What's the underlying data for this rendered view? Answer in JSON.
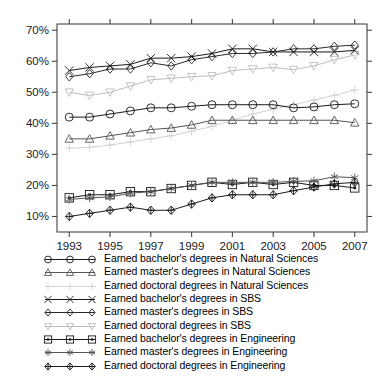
{
  "chart_data": {
    "type": "line",
    "title": "",
    "subtitle": "",
    "xlabel": "",
    "ylabel": "",
    "x": [
      1993,
      1994,
      1995,
      1996,
      1997,
      1998,
      1999,
      2000,
      2001,
      2002,
      2003,
      2004,
      2005,
      2006,
      2007
    ],
    "xlim": [
      1992.4,
      2007.6
    ],
    "ylim": [
      5,
      72
    ],
    "xticks": [
      1993,
      1994,
      1995,
      1996,
      1997,
      1998,
      1999,
      2000,
      2001,
      2002,
      2003,
      2004,
      2005,
      2006,
      2007
    ],
    "xticklabels": [
      "1993",
      "",
      "1995",
      "",
      "1997",
      "",
      "1999",
      "",
      "2001",
      "",
      "2003",
      "",
      "2005",
      "",
      "2007"
    ],
    "yticks": [
      10,
      20,
      30,
      40,
      50,
      60,
      70
    ],
    "yticklabels": [
      "10%",
      "20%",
      "30%",
      "40%",
      "50%",
      "60%",
      "70%"
    ],
    "grid": false,
    "legend_position": "below",
    "series": [
      {
        "name": "Earned bachelor's degrees in Natural Sciences",
        "marker": "circle",
        "color": "#1a1a1a",
        "values": [
          42,
          42,
          43,
          44,
          45,
          45,
          45.5,
          46,
          46,
          46,
          46,
          45,
          45.3,
          46,
          46.3
        ]
      },
      {
        "name": "Earned master's degrees in Natural Sciences",
        "marker": "triangle-up",
        "color": "#555555",
        "values": [
          35,
          35,
          36,
          37,
          38,
          38.5,
          39.5,
          41,
          41,
          41,
          41,
          41,
          41,
          41,
          40.2
        ]
      },
      {
        "name": "Earned doctoral degrees in Natural Sciences",
        "marker": "plus",
        "color": "#d2d2d2",
        "values": [
          32,
          32.3,
          33,
          34,
          35,
          36,
          37.5,
          39,
          41,
          43,
          44.5,
          46,
          47.5,
          49,
          50.8
        ]
      },
      {
        "name": "Earned bachelor's degrees in SBS",
        "marker": "x",
        "color": "#1a1a1a",
        "values": [
          57,
          58,
          58.5,
          59,
          61,
          61,
          61.5,
          62.5,
          64,
          64,
          63,
          63,
          63,
          63,
          63.5
        ]
      },
      {
        "name": "Earned master's degrees in SBS",
        "marker": "diamond",
        "color": "#2b2b2b",
        "values": [
          55,
          56,
          57.5,
          57.5,
          59.5,
          58.5,
          60.5,
          61.5,
          62.5,
          62.5,
          63,
          64,
          64,
          64.8,
          65.2
        ]
      },
      {
        "name": "Earned doctoral degrees in SBS",
        "marker": "triangle-down",
        "color": "#bdbdbd",
        "values": [
          50,
          49,
          50,
          52,
          54,
          54.5,
          55,
          55.3,
          57,
          57.5,
          58,
          57.3,
          58.5,
          60.5,
          62
        ]
      },
      {
        "name": "Earned bachelor's degrees in Engineering",
        "marker": "square-dot",
        "color": "#1a1a1a",
        "values": [
          16,
          17,
          17,
          18,
          18,
          19,
          20,
          21,
          20.3,
          21,
          20.3,
          21,
          20,
          20,
          19.2
        ]
      },
      {
        "name": "Earned master's degrees in Engineering",
        "marker": "asterisk",
        "color": "#555555",
        "values": [
          15.5,
          16,
          16.3,
          17.5,
          18,
          19,
          20,
          21,
          21,
          21,
          21,
          21.3,
          21.5,
          22.8,
          22.5
        ]
      },
      {
        "name": "Earned doctoral degrees in Engineering",
        "marker": "diamond-plus",
        "color": "#1a1a1a",
        "values": [
          10,
          11,
          12,
          13,
          12,
          12,
          14,
          16,
          17,
          17,
          17,
          18.3,
          19.5,
          20.5,
          21
        ]
      }
    ]
  },
  "legend": {
    "entries": [
      {
        "label": "Earned bachelor's degrees in Natural Sciences",
        "marker": "circle",
        "color": "#1a1a1a"
      },
      {
        "label": "Earned master's degrees in Natural Sciences",
        "marker": "triangle-up",
        "color": "#555555"
      },
      {
        "label": "Earned doctoral degrees in Natural Sciences",
        "marker": "plus",
        "color": "#d2d2d2"
      },
      {
        "label": "Earned bachelor's degrees in SBS",
        "marker": "x",
        "color": "#1a1a1a"
      },
      {
        "label": "Earned master's degrees in SBS",
        "marker": "diamond",
        "color": "#2b2b2b"
      },
      {
        "label": "Earned doctoral degrees in SBS",
        "marker": "triangle-down",
        "color": "#bdbdbd"
      },
      {
        "label": "Earned bachelor's degrees in Engineering",
        "marker": "square-dot",
        "color": "#1a1a1a"
      },
      {
        "label": "Earned master's degrees in Engineering",
        "marker": "asterisk",
        "color": "#555555"
      },
      {
        "label": "Earned doctoral degrees in Engineering",
        "marker": "diamond-plus",
        "color": "#1a1a1a"
      }
    ]
  },
  "axes": {
    "frame_color": "#444444"
  }
}
